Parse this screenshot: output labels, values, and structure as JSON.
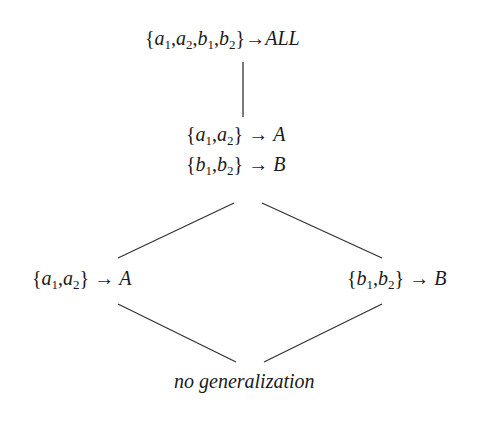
{
  "diagram": {
    "type": "generalization-lattice",
    "nodes": [
      {
        "id": "top",
        "lines": [
          {
            "set": [
              {
                "v": "a",
                "s": "1"
              },
              {
                "v": "a",
                "s": "2"
              },
              {
                "v": "b",
                "s": "1"
              },
              {
                "v": "b",
                "s": "2"
              }
            ],
            "arrow": "→",
            "target": "ALL"
          }
        ]
      },
      {
        "id": "middle",
        "lines": [
          {
            "set": [
              {
                "v": "a",
                "s": "1"
              },
              {
                "v": "a",
                "s": "2"
              }
            ],
            "arrow": "→",
            "target": "A"
          },
          {
            "set": [
              {
                "v": "b",
                "s": "1"
              },
              {
                "v": "b",
                "s": "2"
              }
            ],
            "arrow": "→",
            "target": "B"
          }
        ]
      },
      {
        "id": "left",
        "lines": [
          {
            "set": [
              {
                "v": "a",
                "s": "1"
              },
              {
                "v": "a",
                "s": "2"
              }
            ],
            "arrow": "→",
            "target": "A"
          }
        ]
      },
      {
        "id": "right",
        "lines": [
          {
            "set": [
              {
                "v": "b",
                "s": "1"
              },
              {
                "v": "b",
                "s": "2"
              }
            ],
            "arrow": "→",
            "target": "B"
          }
        ]
      },
      {
        "id": "bottom",
        "label": "no generalization"
      }
    ],
    "edges": [
      {
        "from": "top",
        "to": "middle"
      },
      {
        "from": "middle",
        "to": "left"
      },
      {
        "from": "middle",
        "to": "right"
      },
      {
        "from": "left",
        "to": "bottom"
      },
      {
        "from": "right",
        "to": "bottom"
      }
    ],
    "colors": {
      "line": "#333333",
      "text": "#1a1a1a",
      "background": "#ffffff"
    }
  }
}
